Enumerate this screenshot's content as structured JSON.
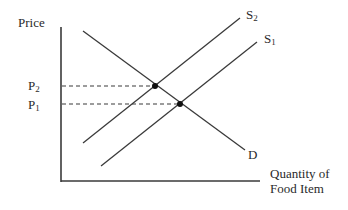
{
  "diagram": {
    "type": "supply-demand",
    "y_axis_label": "Price",
    "x_axis_label_line1": "Quantity of",
    "x_axis_label_line2": "Food Item",
    "curves": {
      "demand": {
        "label": "D"
      },
      "supply_1": {
        "label_base": "S",
        "label_sub": "1"
      },
      "supply_2": {
        "label_base": "S",
        "label_sub": "2"
      }
    },
    "price_levels": {
      "p1": {
        "label_base": "P",
        "label_sub": "1"
      },
      "p2": {
        "label_base": "P",
        "label_sub": "2"
      }
    },
    "colors": {
      "line": "#3a3a3a",
      "point": "#111111",
      "background": "#ffffff"
    }
  }
}
